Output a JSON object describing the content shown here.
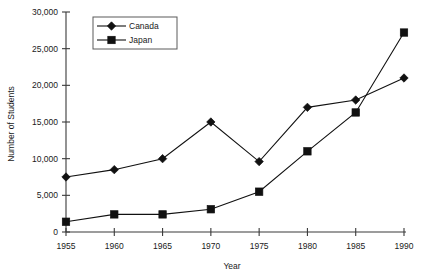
{
  "chart_data": {
    "type": "line",
    "title": "",
    "xlabel": "Year",
    "ylabel": "Number of Students",
    "x": [
      1955,
      1960,
      1965,
      1970,
      1975,
      1980,
      1985,
      1990
    ],
    "xtick_labels": [
      "1955",
      "1960",
      "1965",
      "1970",
      "1975",
      "1980",
      "1985",
      "1990"
    ],
    "ytick_values": [
      0,
      5000,
      10000,
      15000,
      20000,
      25000,
      30000
    ],
    "ytick_labels": [
      "0",
      "5,000",
      "10,000",
      "15,000",
      "20,000",
      "25,000",
      "30,000"
    ],
    "xlim": [
      1955,
      1990
    ],
    "ylim": [
      0,
      30000
    ],
    "grid": false,
    "legend_position": "upper-left-inside",
    "series": [
      {
        "name": "Canada",
        "marker": "diamond",
        "color": "#111111",
        "values": [
          7500,
          8500,
          10000,
          15000,
          9600,
          17000,
          18000,
          21000
        ]
      },
      {
        "name": "Japan",
        "marker": "square",
        "color": "#111111",
        "values": [
          1400,
          2400,
          2400,
          3100,
          5500,
          11000,
          16300,
          27200
        ]
      }
    ]
  },
  "legend": {
    "entries": [
      {
        "label": "Canada",
        "marker": "diamond"
      },
      {
        "label": "Japan",
        "marker": "square"
      }
    ]
  },
  "colors": {
    "background": "#ffffff",
    "axis": "#3a3a3a",
    "ink": "#111111",
    "legend_border": "#5a5a5a"
  }
}
